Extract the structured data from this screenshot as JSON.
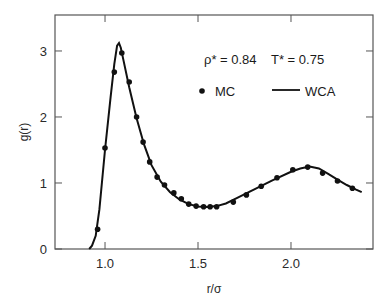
{
  "chart_data": {
    "type": "line",
    "title": "",
    "xlabel": "r/σ",
    "ylabel": "g(r)",
    "xlim": [
      0.731,
      2.441
    ],
    "ylim": [
      0,
      3.545
    ],
    "grid": false,
    "x_ticks": [
      1.0,
      1.5,
      2.0
    ],
    "x_tick_labels": [
      "1.0",
      "1.5",
      "2.0"
    ],
    "y_ticks": [
      0,
      1,
      2,
      3
    ],
    "y_tick_labels": [
      "0",
      "1",
      "2",
      "3"
    ],
    "annotations": {
      "density": "ρ* = 0.84",
      "temperature": "T* = 0.75"
    },
    "legend": {
      "position": "upper right, inside",
      "entries": [
        {
          "label": "MC",
          "marker": "dot"
        },
        {
          "label": "WCA",
          "marker": "line"
        }
      ]
    },
    "series": [
      {
        "name": "MC",
        "style": "scatter",
        "x": [
          0.96,
          1.0,
          1.05,
          1.09,
          1.13,
          1.17,
          1.205,
          1.24,
          1.28,
          1.32,
          1.37,
          1.41,
          1.45,
          1.49,
          1.53,
          1.565,
          1.6,
          1.69,
          1.76,
          1.84,
          1.925,
          2.01,
          2.09,
          2.17,
          2.25,
          2.33
        ],
        "y": [
          0.3,
          1.53,
          2.68,
          2.97,
          2.53,
          2.0,
          1.62,
          1.32,
          1.09,
          0.97,
          0.85,
          0.76,
          0.68,
          0.65,
          0.64,
          0.64,
          0.64,
          0.71,
          0.82,
          0.95,
          1.08,
          1.2,
          1.24,
          1.15,
          1.03,
          0.92
        ]
      },
      {
        "name": "WCA",
        "style": "line",
        "x": [
          0.915,
          0.93,
          0.95,
          0.97,
          1.0,
          1.03,
          1.05,
          1.065,
          1.075,
          1.085,
          1.1,
          1.13,
          1.17,
          1.21,
          1.25,
          1.3,
          1.35,
          1.4,
          1.45,
          1.5,
          1.55,
          1.6,
          1.65,
          1.7,
          1.8,
          1.9,
          2.0,
          2.05,
          2.1,
          2.15,
          2.2,
          2.25,
          2.3,
          2.35,
          2.38
        ],
        "y": [
          0.0,
          0.05,
          0.2,
          0.6,
          1.5,
          2.3,
          2.8,
          3.08,
          3.12,
          3.05,
          2.85,
          2.45,
          1.98,
          1.58,
          1.27,
          1.02,
          0.86,
          0.75,
          0.68,
          0.645,
          0.635,
          0.65,
          0.69,
          0.76,
          0.9,
          1.04,
          1.17,
          1.22,
          1.25,
          1.22,
          1.14,
          1.05,
          0.97,
          0.9,
          0.86
        ]
      }
    ]
  }
}
